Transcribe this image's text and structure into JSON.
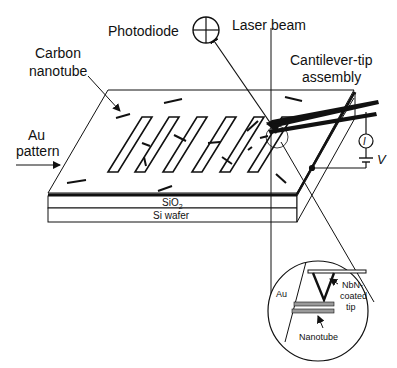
{
  "diagram": {
    "labels": {
      "photodiode": "Photodiode",
      "laser_beam": "Laser beam",
      "cantilever_line1": "Cantilever-tip",
      "cantilever_line2": "assembly",
      "carbon_line1": "Carbon",
      "carbon_line2": "nanotube",
      "au_line1": "Au",
      "au_line2": "pattern",
      "sio2": "SiO",
      "sio2_sub": "2",
      "si_wafer": "Si wafer",
      "current_symbol": "I",
      "voltage_symbol": "V",
      "inset_au": "Au",
      "inset_nbn_line1": "NbN-",
      "inset_nbn_line2": "coated",
      "inset_nbn_line3": "tip",
      "inset_nanotube": "Nanotube"
    },
    "colors": {
      "ink": "#111111",
      "background": "#ffffff",
      "layer_gray": "#9a9a9a"
    }
  }
}
